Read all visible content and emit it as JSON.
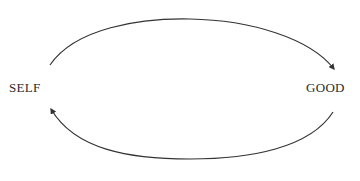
{
  "diagram": {
    "nodes": [
      {
        "id": "self",
        "label": "SELF"
      },
      {
        "id": "good",
        "label": "GOOD"
      }
    ],
    "edges": [
      {
        "from": "self",
        "to": "good",
        "position": "top-arc"
      },
      {
        "from": "good",
        "to": "self",
        "position": "bottom-arc"
      }
    ],
    "colors": {
      "line": "#333333",
      "text": "#2a2a2a",
      "background": "#ffffff"
    }
  }
}
